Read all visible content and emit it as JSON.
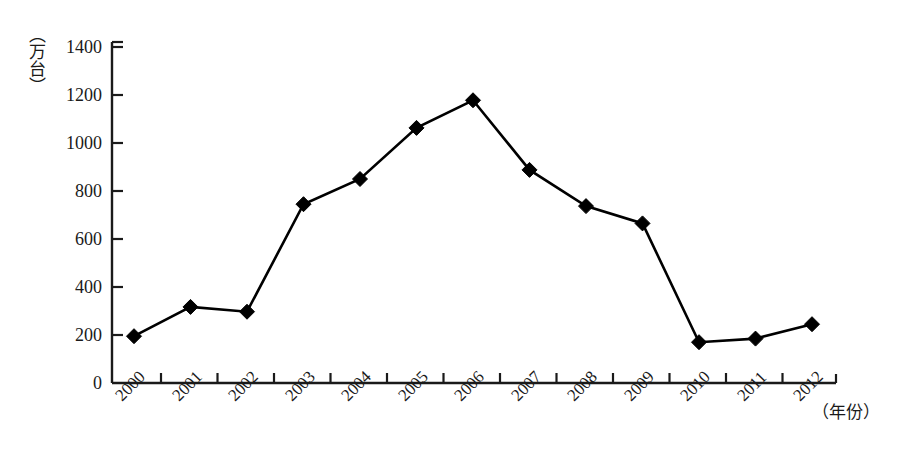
{
  "chart_data": {
    "type": "line",
    "title": "",
    "subtitle": "",
    "xlabel": "（年份）",
    "ylabel": "（万台）",
    "categories": [
      "2000",
      "2001",
      "2002",
      "2003",
      "2004",
      "2005",
      "2006",
      "2007",
      "2008",
      "2009",
      "2010",
      "2011",
      "2012"
    ],
    "values": [
      195,
      317,
      297,
      745,
      850,
      1063,
      1178,
      888,
      737,
      665,
      170,
      185,
      245
    ],
    "ylim": [
      0,
      1400
    ],
    "yticks": [
      "0",
      "200",
      "400",
      "600",
      "800",
      "1000",
      "1200",
      "1400"
    ],
    "ytick_values": [
      0,
      200,
      400,
      600,
      800,
      1000,
      1200,
      1400
    ],
    "grid": false,
    "legend": "none",
    "marker": "diamond",
    "line_color": "#000000",
    "marker_color": "#000000",
    "axis_color": "#1a1a1a"
  },
  "axes": {
    "y_unit": "（万台）",
    "x_unit": "（年份）"
  }
}
